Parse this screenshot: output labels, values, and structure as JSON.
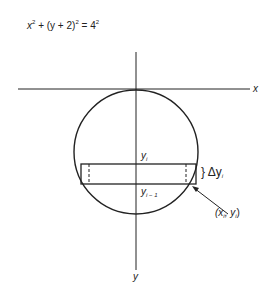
{
  "equation": {
    "lhs_x": "x",
    "exp1": "2",
    "plus": "+",
    "paren_open": "(y + 2)",
    "exp2": "2",
    "equals": "=",
    "rhs": "4",
    "exp3": "2"
  },
  "axes": {
    "x_label": "x",
    "y_label": "y"
  },
  "labels": {
    "yi": "y",
    "yi_sub": "i",
    "yi1": "y",
    "yi1_sub": "i − 1",
    "delta": "} Δy",
    "delta_sub": "i",
    "point": "(x",
    "point_sub1": "i",
    "point_mid": ", y",
    "point_sub2": "i",
    "point_close": ")"
  },
  "geometry": {
    "circle": {
      "cx": 136,
      "cy": 152,
      "r": 63
    },
    "strip": {
      "x1": 81,
      "x2": 196,
      "y_top": 164,
      "y_bottom": 184
    }
  }
}
